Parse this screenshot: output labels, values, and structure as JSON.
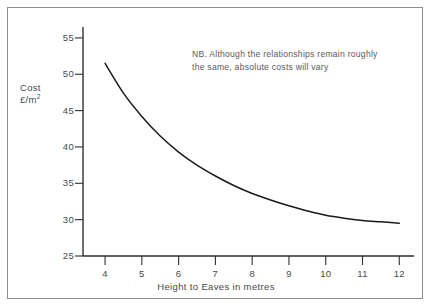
{
  "figure": {
    "border_color": "#8e8e8e",
    "background": "#ffffff",
    "axis_color": "#2e2e2e",
    "curve_color": "#1a1a1a",
    "text_color": "#4a4a4a"
  },
  "axes": {
    "y_title_line1": "Cost",
    "y_title_unit_text": "£/m",
    "y_title_unit_exponent": "2",
    "x_title": "Height to Eaves in metres",
    "y_ticks": [
      "25",
      "30",
      "35",
      "40",
      "45",
      "50",
      "55"
    ],
    "x_ticks": [
      "4",
      "5",
      "6",
      "7",
      "8",
      "9",
      "10",
      "11",
      "12"
    ]
  },
  "note": {
    "line1": "NB. Although the relationships remain roughly",
    "line2": "the same, absolute costs will vary"
  },
  "chart_data": {
    "type": "line",
    "title": "",
    "subtitle": "",
    "xlabel": "Height to Eaves in metres",
    "ylabel": "Cost £/m2",
    "xlim": [
      3.4,
      12.4
    ],
    "ylim": [
      25,
      56.5
    ],
    "xticks": [
      4,
      5,
      6,
      7,
      8,
      9,
      10,
      11,
      12
    ],
    "yticks": [
      25,
      30,
      35,
      40,
      45,
      50,
      55
    ],
    "grid": false,
    "legend": null,
    "annotations": [
      {
        "text": "NB. Although the relationships remain roughly the same, absolute costs will vary",
        "x": 6.9,
        "y": 53.5
      }
    ],
    "series": [
      {
        "name": "Cost per square metre",
        "x": [
          4,
          4.5,
          5,
          5.5,
          6,
          6.5,
          7,
          7.5,
          8,
          8.5,
          9,
          9.5,
          10,
          10.5,
          11,
          11.5,
          12
        ],
        "values": [
          51.5,
          47.4,
          44.2,
          41.5,
          39.3,
          37.5,
          36.0,
          34.7,
          33.6,
          32.7,
          31.9,
          31.2,
          30.6,
          30.2,
          29.9,
          29.7,
          29.5
        ]
      }
    ]
  }
}
